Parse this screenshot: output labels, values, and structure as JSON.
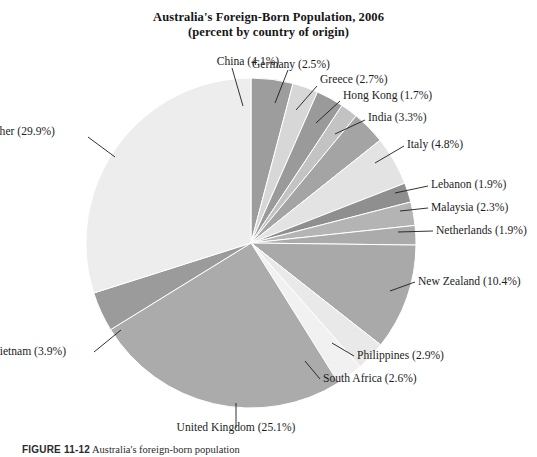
{
  "figure": {
    "title_line1": "Australia's Foreign-Born Population, 2006",
    "title_line2": "(percent by country of origin)",
    "caption_number": "FIGURE 11-12",
    "caption_text": "Australia's foreign-born population"
  },
  "chart_data": {
    "type": "pie",
    "title": "Australia's Foreign-Born Population, 2006",
    "subtitle": "(percent by country of origin)",
    "unit": "percent",
    "legend": "none",
    "labels_inline": true,
    "start_angle_deg": -90,
    "direction": "clockwise",
    "categories": [
      "China",
      "Germany",
      "Greece",
      "Hong Kong",
      "India",
      "Italy",
      "Lebanon",
      "Malaysia",
      "Netherlands",
      "New Zealand",
      "Philippines",
      "South Africa",
      "United Kingdom",
      "Vietnam",
      "Other"
    ],
    "values": [
      4.1,
      2.5,
      2.7,
      1.7,
      3.3,
      4.8,
      1.9,
      2.3,
      1.9,
      10.4,
      2.9,
      2.6,
      25.1,
      3.9,
      29.9
    ],
    "colors": [
      "#9d9d9d",
      "#d7d7d7",
      "#9a9a9a",
      "#c3c3c3",
      "#a4a4a4",
      "#e3e3e3",
      "#8f8f8f",
      "#b4b4b4",
      "#ababab",
      "#a9a9a9",
      "#e9e9e9",
      "#f1f1f1",
      "#ababab",
      "#9b9b9b",
      "#ededed"
    ],
    "slice_labels": [
      "China (4.1%)",
      "Germany (2.5%)",
      "Greece (2.7%)",
      "Hong Kong (1.7%)",
      "India (3.3%)",
      "Italy (4.8%)",
      "Lebanon (1.9%)",
      "Malaysia (2.3%)",
      "Netherlands (1.9%)",
      "New Zealand (10.4%)",
      "Philippines (2.9%)",
      "South Africa (2.6%)",
      "United Kingdom (25.1%)",
      "Vietnam (3.9%)",
      "Other (29.9%)"
    ]
  },
  "labels": {
    "china": "China (4.1%)",
    "germany": "Germany (2.5%)",
    "greece": "Greece (2.7%)",
    "hong_kong": "Hong Kong (1.7%)",
    "india": "India (3.3%)",
    "italy": "Italy (4.8%)",
    "lebanon": "Lebanon (1.9%)",
    "malaysia": "Malaysia (2.3%)",
    "netherlands": "Netherlands (1.9%)",
    "new_zealand": "New Zealand (10.4%)",
    "philippines": "Philippines (2.9%)",
    "south_africa": "South Africa (2.6%)",
    "united_kingdom": "United Kingdom (25.1%)",
    "vietnam": "Vietnam (3.9%)",
    "other": "Other (29.9%)"
  }
}
